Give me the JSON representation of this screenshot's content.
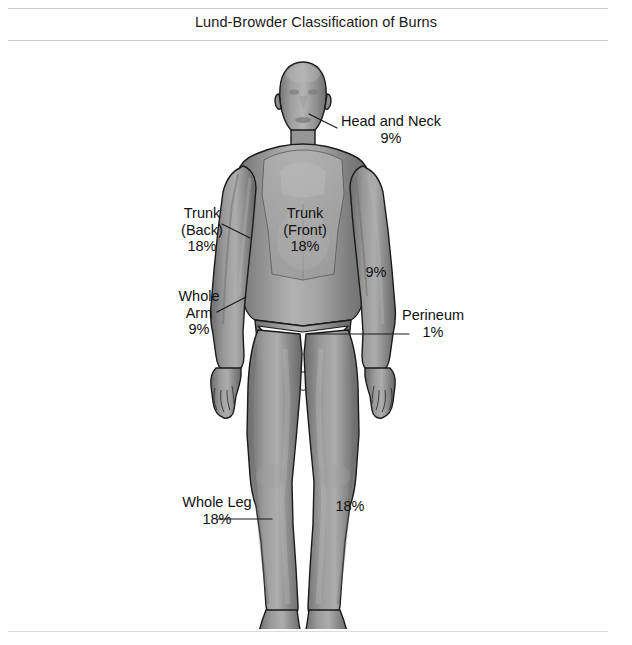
{
  "header": {
    "title": "Lund-Browder Classification of Burns"
  },
  "diagram": {
    "colors": {
      "outline": "#1a1a1a",
      "skin_mid": "#8a8a8a",
      "skin_light": "#b8b8b8",
      "skin_dark": "#6a6a6a",
      "label_text": "#111111",
      "leader_line": "#1a1a1a",
      "rule": "#c9c9c9",
      "background": "#ffffff"
    },
    "labels": [
      {
        "id": "head-and-neck",
        "name": "Head and Neck",
        "value": "9%"
      },
      {
        "id": "trunk-back",
        "name": "Trunk",
        "qualifier": "(Back)",
        "value": "18%"
      },
      {
        "id": "trunk-front",
        "name": "Trunk",
        "qualifier": "(Front)",
        "value": "18%"
      },
      {
        "id": "arm-right",
        "name": "",
        "value": "9%"
      },
      {
        "id": "whole-arm",
        "name": "Whole",
        "qualifier": "Arm",
        "value": "9%"
      },
      {
        "id": "perineum",
        "name": "Perineum",
        "value": "1%"
      },
      {
        "id": "whole-leg",
        "name": "Whole Leg",
        "value": "18%"
      },
      {
        "id": "leg-right",
        "name": "",
        "value": "18%"
      }
    ],
    "head_and_neck": {
      "line1": "Head and Neck",
      "line2": "9%"
    },
    "trunk_back": {
      "line1": "Trunk",
      "line2": "(Back)",
      "line3": "18%"
    },
    "trunk_front": {
      "line1": "Trunk",
      "line2": "(Front)",
      "line3": "18%"
    },
    "arm_right": {
      "line1": "9%"
    },
    "whole_arm": {
      "line1": "Whole",
      "line2": "Arm",
      "line3": "9%"
    },
    "perineum": {
      "line1": "Perineum",
      "line2": "1%"
    },
    "whole_leg": {
      "line1": "Whole Leg",
      "line2": "18%"
    },
    "leg_right": {
      "line1": "18%"
    }
  }
}
